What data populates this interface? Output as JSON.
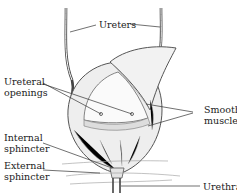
{
  "diagram": {
    "labels": {
      "ureters": "Ureters",
      "ureteral_openings_1": "Ureteral",
      "ureteral_openings_2": "openings",
      "smooth_muscle_1": "Smooth",
      "smooth_muscle_2": "muscle",
      "internal_sphincter_1": "Internal",
      "internal_sphincter_2": "sphincter",
      "external_sphincter_1": "External",
      "external_sphincter_2": "sphincter",
      "urethra": "Urethra"
    },
    "colors": {
      "line": "#333333",
      "shade": "#999999",
      "fill": "#f4f4f4"
    }
  }
}
